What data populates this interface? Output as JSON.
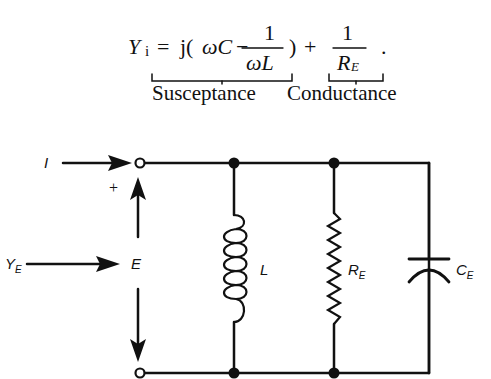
{
  "equation": {
    "lhs_symbol": "Y",
    "lhs_subscript": "i",
    "equals": "=",
    "j_open": "j(",
    "omega_c": "ωC",
    "minus": "−",
    "frac1_num": "1",
    "frac1_den": "ωL",
    "close_paren": ")",
    "plus": "+",
    "frac2_num": "1",
    "frac2_den_symbol": "R",
    "frac2_den_subscript": "E",
    "period": ".",
    "brace_labels": {
      "susceptance": "Susceptance",
      "conductance": "Conductance"
    }
  },
  "circuit": {
    "labels": {
      "current": "I",
      "plus_sign": "+",
      "admittance_symbol": "Y",
      "admittance_subscript": "E",
      "voltage": "E",
      "inductor": "L",
      "resistor_symbol": "R",
      "resistor_subscript": "E",
      "capacitor_symbol": "C",
      "capacitor_subscript": "E"
    },
    "components": [
      "inductor L",
      "resistor R_E",
      "capacitor C_E"
    ],
    "topology": "parallel",
    "line_color": "#111111"
  }
}
